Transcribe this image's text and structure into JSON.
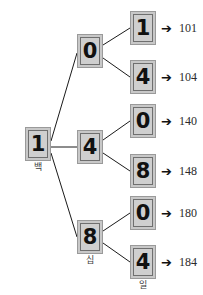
{
  "top_text": {
    "clipped_line": "— —— — — — — — —"
  },
  "diagram": {
    "type": "tree",
    "root": {
      "digit": "1",
      "place_label": "백"
    },
    "level2": [
      {
        "digit": "0",
        "place_label": ""
      },
      {
        "digit": "4",
        "place_label": ""
      },
      {
        "digit": "8",
        "place_label": "십"
      }
    ],
    "level3": [
      {
        "digit": "1",
        "place_label": ""
      },
      {
        "digit": "4",
        "place_label": ""
      },
      {
        "digit": "0",
        "place_label": ""
      },
      {
        "digit": "8",
        "place_label": ""
      },
      {
        "digit": "0",
        "place_label": ""
      },
      {
        "digit": "4",
        "place_label": "일"
      }
    ],
    "results": [
      {
        "arrow": "➔",
        "value": "101"
      },
      {
        "arrow": "➔",
        "value": "104"
      },
      {
        "arrow": "➔",
        "value": "140"
      },
      {
        "arrow": "➔",
        "value": "148"
      },
      {
        "arrow": "➔",
        "value": "180"
      },
      {
        "arrow": "➔",
        "value": "184"
      }
    ],
    "colors": {
      "node_fill": "#cfcfcf",
      "node_outer": "#c8c8c8",
      "node_border": "#6f6f6f",
      "edge": "#1a1a1a",
      "digit": "#111111",
      "result_text": "#2b2b2b"
    }
  }
}
